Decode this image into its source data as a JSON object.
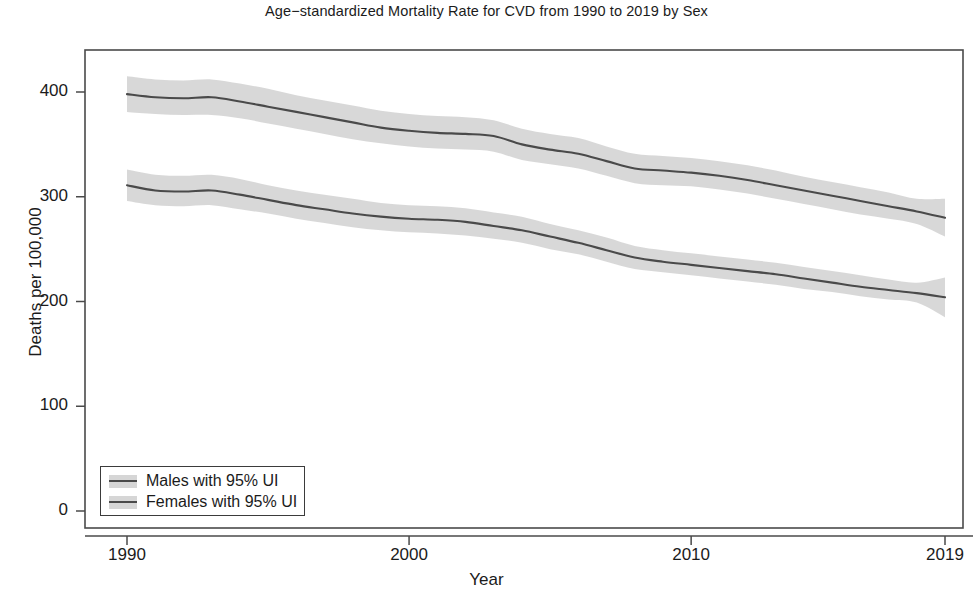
{
  "chart_data": {
    "type": "line",
    "title": "Age−standardized Mortality Rate for CVD from 1990 to 2019 by Sex",
    "xlabel": "Year",
    "ylabel": "Deaths per 100,000",
    "xlim": [
      1990,
      2019
    ],
    "ylim": [
      0,
      430
    ],
    "grid": false,
    "legend_position": "bottom-left",
    "x_ticks": [
      "1990",
      "2000",
      "2010",
      "2019"
    ],
    "x_tick_values": [
      1990,
      2000,
      2010,
      2019
    ],
    "y_ticks": [
      "0",
      "100",
      "200",
      "300",
      "400"
    ],
    "y_tick_values": [
      0,
      100,
      200,
      300,
      400
    ],
    "x": [
      1990,
      1991,
      1992,
      1993,
      1994,
      1995,
      1996,
      1997,
      1998,
      1999,
      2000,
      2001,
      2002,
      2003,
      2004,
      2005,
      2006,
      2007,
      2008,
      2009,
      2010,
      2011,
      2012,
      2013,
      2014,
      2015,
      2016,
      2017,
      2018,
      2019
    ],
    "series": [
      {
        "name": "Males with 95% UI",
        "color": "#4a4a4a",
        "band_color": "#d6d6d6",
        "values": [
          398,
          395,
          394,
          395,
          391,
          386,
          381,
          376,
          371,
          366,
          363,
          361,
          360,
          358,
          350,
          345,
          341,
          334,
          327,
          325,
          323,
          320,
          316,
          311,
          306,
          301,
          296,
          291,
          286,
          280
        ],
        "lower": [
          381,
          379,
          378,
          378,
          375,
          370,
          365,
          360,
          355,
          351,
          348,
          346,
          345,
          343,
          335,
          331,
          327,
          320,
          313,
          311,
          310,
          307,
          303,
          298,
          293,
          288,
          283,
          279,
          274,
          262
        ],
        "upper": [
          415,
          412,
          411,
          412,
          408,
          403,
          397,
          392,
          387,
          382,
          379,
          377,
          376,
          373,
          365,
          360,
          356,
          348,
          341,
          339,
          337,
          334,
          330,
          325,
          319,
          314,
          309,
          304,
          298,
          298
        ]
      },
      {
        "name": "Females with 95% UI",
        "color": "#4a4a4a",
        "band_color": "#d6d6d6",
        "values": [
          311,
          306,
          305,
          306,
          302,
          297,
          292,
          288,
          284,
          281,
          279,
          278,
          276,
          272,
          268,
          262,
          256,
          249,
          242,
          238,
          235,
          232,
          229,
          226,
          222,
          218,
          214,
          211,
          208,
          204
        ],
        "lower": [
          296,
          292,
          291,
          292,
          288,
          284,
          279,
          275,
          271,
          268,
          266,
          265,
          263,
          260,
          256,
          250,
          245,
          238,
          231,
          228,
          225,
          222,
          219,
          216,
          212,
          209,
          205,
          202,
          199,
          185
        ],
        "upper": [
          326,
          321,
          320,
          321,
          317,
          311,
          306,
          302,
          298,
          294,
          292,
          291,
          289,
          285,
          281,
          274,
          268,
          261,
          253,
          249,
          246,
          243,
          240,
          237,
          233,
          229,
          225,
          221,
          218,
          223
        ]
      }
    ]
  },
  "figure": {
    "title": "Age−standardized Mortality Rate for CVD from 1990 to 2019 by Sex",
    "x_axis_title": "Year",
    "y_axis_title": "Deaths per 100,000",
    "legend": {
      "entries": [
        {
          "label": "Males with 95% UI"
        },
        {
          "label": "Females with 95% UI"
        }
      ]
    },
    "y_tick_labels": [
      "0",
      "100",
      "200",
      "300",
      "400"
    ],
    "x_tick_labels": [
      "1990",
      "2000",
      "2010",
      "2019"
    ]
  }
}
